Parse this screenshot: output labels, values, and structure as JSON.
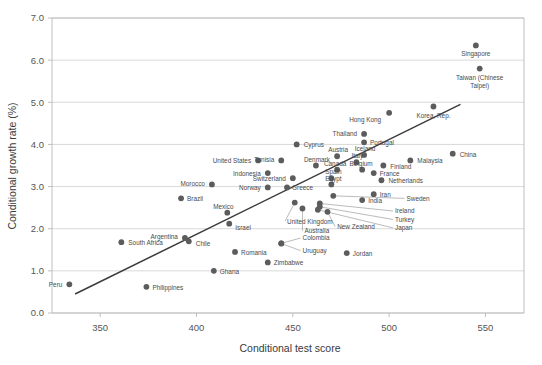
{
  "chart_data": {
    "type": "scatter",
    "title": "",
    "xlabel": "Conditional test score",
    "ylabel": "Conditional growth rate (%)",
    "xlim": [
      325,
      570
    ],
    "ylim": [
      0.0,
      7.0
    ],
    "xticks": [
      "350",
      "400",
      "450",
      "500",
      "550"
    ],
    "xtick_values": [
      350,
      400,
      450,
      500,
      550
    ],
    "yticks": [
      "0.0",
      "1.0",
      "2.0",
      "3.0",
      "4.0",
      "5.0",
      "6.0",
      "7.0"
    ],
    "ytick_values": [
      0.0,
      1.0,
      2.0,
      3.0,
      4.0,
      5.0,
      6.0,
      7.0
    ],
    "grid": true,
    "legend": false,
    "trend_line": {
      "x0": 337,
      "y0": 0.45,
      "x1": 537,
      "y1": 4.95
    },
    "points": [
      {
        "label": "Singapore",
        "x": 545,
        "y": 6.35,
        "label_dx": 0,
        "label_dy": 11,
        "anchor": "middle"
      },
      {
        "label": "Taiwan (Chinese Taipei)",
        "x": 547,
        "y": 5.8,
        "label_dx": 0,
        "label_dy": 11,
        "anchor": "middle",
        "label2": "Taipei)"
      },
      {
        "label": "Korea, Rep.",
        "x": 523,
        "y": 4.9,
        "label_dx": 0,
        "label_dy": 11,
        "anchor": "middle"
      },
      {
        "label": "Hong Kong",
        "x": 500,
        "y": 4.75,
        "label_dx": -8,
        "label_dy": 9,
        "anchor": "end"
      },
      {
        "label": "Thailand",
        "x": 487,
        "y": 4.25,
        "label_dx": -7,
        "label_dy": 2,
        "anchor": "end"
      },
      {
        "label": "Portugal",
        "x": 487,
        "y": 4.05,
        "label_dx": 6,
        "label_dy": 3,
        "anchor": "start"
      },
      {
        "label": "China",
        "x": 533,
        "y": 3.78,
        "label_dx": 7,
        "label_dy": 3,
        "anchor": "start"
      },
      {
        "label": "Malaysia",
        "x": 511,
        "y": 3.62,
        "label_dx": 7,
        "label_dy": 3,
        "anchor": "start"
      },
      {
        "label": "Cyprus",
        "x": 452,
        "y": 4.0,
        "label_dx": 7,
        "label_dy": 3,
        "anchor": "start"
      },
      {
        "label": "Iceland",
        "x": 487,
        "y": 3.75,
        "label_dx": 1,
        "label_dy": -4,
        "anchor": "middle"
      },
      {
        "label": "Austria",
        "x": 473,
        "y": 3.72,
        "label_dx": 1,
        "label_dy": -4,
        "anchor": "middle"
      },
      {
        "label": "Italy",
        "x": 483,
        "y": 3.58,
        "label_dx": 1,
        "label_dy": -4,
        "anchor": "middle"
      },
      {
        "label": "Finland",
        "x": 497,
        "y": 3.5,
        "label_dx": 7,
        "label_dy": 3,
        "anchor": "start"
      },
      {
        "label": "Tunisia",
        "x": 444,
        "y": 3.62,
        "label_dx": -7,
        "label_dy": 2,
        "anchor": "end"
      },
      {
        "label": "United States",
        "x": 432,
        "y": 3.62,
        "label_dx": -7,
        "label_dy": 3,
        "anchor": "end"
      },
      {
        "label": "Denmark",
        "x": 462,
        "y": 3.5,
        "label_dx": 1,
        "label_dy": -4,
        "anchor": "middle"
      },
      {
        "label": "Canada",
        "x": 473,
        "y": 3.4,
        "label_dx": -2,
        "label_dy": -4,
        "anchor": "middle"
      },
      {
        "label": "Belgium",
        "x": 486,
        "y": 3.4,
        "label_dx": -1,
        "label_dy": -4,
        "anchor": "middle"
      },
      {
        "label": "France",
        "x": 492,
        "y": 3.32,
        "label_dx": 6,
        "label_dy": 3,
        "anchor": "start"
      },
      {
        "label": "Indonesia",
        "x": 437,
        "y": 3.32,
        "label_dx": -7,
        "label_dy": 3,
        "anchor": "end"
      },
      {
        "label": "Switzerland",
        "x": 450,
        "y": 3.2,
        "label_dx": -7,
        "label_dy": 3,
        "anchor": "end"
      },
      {
        "label": "Spain",
        "x": 470,
        "y": 3.2,
        "label_dx": 2,
        "label_dy": -4,
        "anchor": "middle"
      },
      {
        "label": "Netherlands",
        "x": 496,
        "y": 3.15,
        "label_dx": 7,
        "label_dy": 3,
        "anchor": "start"
      },
      {
        "label": "Morocco",
        "x": 408,
        "y": 3.05,
        "label_dx": -7,
        "label_dy": 2,
        "anchor": "end"
      },
      {
        "label": "Egypt",
        "x": 470,
        "y": 3.05,
        "label_dx": 2,
        "label_dy": -3,
        "anchor": "middle"
      },
      {
        "label": "Norway",
        "x": 437,
        "y": 2.98,
        "label_dx": -7,
        "label_dy": 3,
        "anchor": "end"
      },
      {
        "label": "Greece",
        "x": 447,
        "y": 2.98,
        "label_dx": 5,
        "label_dy": 3,
        "anchor": "start"
      },
      {
        "label": "Iran",
        "x": 492,
        "y": 2.82,
        "label_dx": 6,
        "label_dy": 3,
        "anchor": "start"
      },
      {
        "label": "Sweden",
        "x": 471,
        "y": 2.78,
        "label_dx": 0,
        "label_dy": 0,
        "anchor": "start",
        "leader": true,
        "lx": 508,
        "ly": 2.72
      },
      {
        "label": "India",
        "x": 486,
        "y": 2.68,
        "label_dx": 6,
        "label_dy": 3,
        "anchor": "start"
      },
      {
        "label": "Brazil",
        "x": 392,
        "y": 2.72,
        "label_dx": 6,
        "label_dy": 3,
        "anchor": "start"
      },
      {
        "label": "Ireland",
        "x": 464,
        "y": 2.6,
        "label_dx": 0,
        "label_dy": 0,
        "anchor": "start",
        "leader": true,
        "lx": 502,
        "ly": 2.42
      },
      {
        "label": "Turkey",
        "x": 464,
        "y": 2.52,
        "label_dx": 0,
        "label_dy": 0,
        "anchor": "start",
        "leader": true,
        "lx": 502,
        "ly": 2.22
      },
      {
        "label": "Japan",
        "x": 463,
        "y": 2.45,
        "label_dx": 0,
        "label_dy": 0,
        "anchor": "start",
        "leader": true,
        "lx": 502,
        "ly": 2.02
      },
      {
        "label": "United Kingdom",
        "x": 451,
        "y": 2.62,
        "label_dx": 0,
        "label_dy": 0,
        "anchor": "middle",
        "leader": true,
        "lx": 446,
        "ly": 2.18
      },
      {
        "label": "Australia",
        "x": 455,
        "y": 2.48,
        "label_dx": 0,
        "label_dy": 0,
        "anchor": "middle",
        "leader": true,
        "lx": 455,
        "ly": 1.95
      },
      {
        "label": "New Zealand",
        "x": 468,
        "y": 2.4,
        "label_dx": 0,
        "label_dy": 0,
        "anchor": "start",
        "leader": true,
        "lx": 472,
        "ly": 2.05
      },
      {
        "label": "Mexico",
        "x": 416,
        "y": 2.38,
        "label_dx": -4,
        "label_dy": -4,
        "anchor": "middle"
      },
      {
        "label": "Israel",
        "x": 417,
        "y": 2.12,
        "label_dx": 6,
        "label_dy": 6,
        "anchor": "start"
      },
      {
        "label": "Argentina",
        "x": 394,
        "y": 1.78,
        "label_dx": -7,
        "label_dy": 1,
        "anchor": "end"
      },
      {
        "label": "Chile",
        "x": 396,
        "y": 1.7,
        "label_dx": 7,
        "label_dy": 5,
        "anchor": "start"
      },
      {
        "label": "South Africa",
        "x": 361,
        "y": 1.68,
        "label_dx": 7,
        "label_dy": 3,
        "anchor": "start"
      },
      {
        "label": "Colombia",
        "x": 444,
        "y": 1.65,
        "label_dx": 0,
        "label_dy": 0,
        "anchor": "start",
        "leader": true,
        "lx": 454,
        "ly": 1.78
      },
      {
        "label": "Uruguay",
        "x": 444,
        "y": 1.65,
        "label_dx": 0,
        "label_dy": 0,
        "anchor": "start",
        "leader": true,
        "lx": 454,
        "ly": 1.48
      },
      {
        "label": "Romania",
        "x": 420,
        "y": 1.45,
        "label_dx": 6,
        "label_dy": 3,
        "anchor": "start"
      },
      {
        "label": "Jordan",
        "x": 478,
        "y": 1.42,
        "label_dx": 6,
        "label_dy": 3,
        "anchor": "start"
      },
      {
        "label": "Zimbabwe",
        "x": 437,
        "y": 1.2,
        "label_dx": 6,
        "label_dy": 3,
        "anchor": "start"
      },
      {
        "label": "Ghana",
        "x": 409,
        "y": 1.0,
        "label_dx": 6,
        "label_dy": 3,
        "anchor": "start"
      },
      {
        "label": "Peru",
        "x": 334,
        "y": 0.68,
        "label_dx": -7,
        "label_dy": 3,
        "anchor": "end"
      },
      {
        "label": "Philippines",
        "x": 374,
        "y": 0.62,
        "label_dx": 6,
        "label_dy": 3,
        "anchor": "start"
      }
    ]
  },
  "axes": {
    "x_title": "Conditional test score",
    "y_title": "Conditional growth rate (%)"
  }
}
